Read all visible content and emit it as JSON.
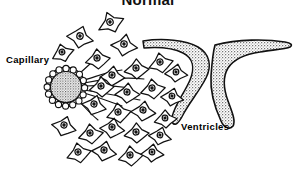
{
  "figure": {
    "title": "Normal",
    "width": 296,
    "height": 169,
    "background_color": "#ffffff",
    "ink_color": "#000000",
    "stipple_color": "#b4b4b4",
    "labels": {
      "capillary": "Capillary",
      "ventricles": "Ventricles"
    },
    "structures": {
      "capillary": {
        "name": "capillary",
        "shape": "stippled circle with scalloped endothelial ring",
        "center_x": 66,
        "center_y": 87,
        "radius": 18,
        "fill": "#c8c8c8"
      },
      "ventricle_inner": {
        "name": "ventricle-inner",
        "shape": "crescent hook opening left",
        "fill": "#c4c4c4"
      },
      "ventricle_outer": {
        "name": "ventricle-outer",
        "shape": "larger crescent hook opening left",
        "fill": "#c4c4c4"
      },
      "astrocytes": {
        "name": "astrocytes",
        "description": "star-shaped glial cells with central nucleus and radiating processes",
        "count": 26,
        "fill": "#ffffff",
        "nucleus_fill": "#ffffff"
      }
    },
    "cells": [
      {
        "x": 110,
        "y": 22,
        "r": 13,
        "rot": -18
      },
      {
        "x": 80,
        "y": 36,
        "r": 13,
        "rot": 12
      },
      {
        "x": 124,
        "y": 44,
        "r": 13,
        "rot": 8
      },
      {
        "x": 97,
        "y": 58,
        "r": 12,
        "rot": -8
      },
      {
        "x": 136,
        "y": 68,
        "r": 12,
        "rot": -4
      },
      {
        "x": 160,
        "y": 62,
        "r": 12,
        "rot": -14
      },
      {
        "x": 176,
        "y": 72,
        "r": 11,
        "rot": 6
      },
      {
        "x": 112,
        "y": 75,
        "r": 12,
        "rot": 4
      },
      {
        "x": 101,
        "y": 86,
        "r": 12,
        "rot": -6
      },
      {
        "x": 127,
        "y": 92,
        "r": 12,
        "rot": 2
      },
      {
        "x": 152,
        "y": 88,
        "r": 12,
        "rot": -10
      },
      {
        "x": 172,
        "y": 96,
        "r": 11,
        "rot": 10
      },
      {
        "x": 94,
        "y": 104,
        "r": 12,
        "rot": 14
      },
      {
        "x": 118,
        "y": 112,
        "r": 12,
        "rot": -12
      },
      {
        "x": 143,
        "y": 110,
        "r": 12,
        "rot": 6
      },
      {
        "x": 165,
        "y": 118,
        "r": 11,
        "rot": -6
      },
      {
        "x": 64,
        "y": 125,
        "r": 12,
        "rot": 16
      },
      {
        "x": 90,
        "y": 133,
        "r": 12,
        "rot": -10
      },
      {
        "x": 112,
        "y": 127,
        "r": 12,
        "rot": 8
      },
      {
        "x": 136,
        "y": 132,
        "r": 12,
        "rot": -4
      },
      {
        "x": 160,
        "y": 135,
        "r": 11,
        "rot": 12
      },
      {
        "x": 78,
        "y": 152,
        "r": 12,
        "rot": -14
      },
      {
        "x": 104,
        "y": 150,
        "r": 12,
        "rot": 10
      },
      {
        "x": 130,
        "y": 155,
        "r": 12,
        "rot": -8
      },
      {
        "x": 152,
        "y": 152,
        "r": 11,
        "rot": 4
      },
      {
        "x": 62,
        "y": 52,
        "r": 11,
        "rot": -20
      }
    ],
    "endfeet": [
      {
        "x1": 86,
        "y1": 80,
        "x2": 120,
        "y2": 72
      },
      {
        "x1": 86,
        "y1": 86,
        "x2": 130,
        "y2": 88
      },
      {
        "x1": 86,
        "y1": 92,
        "x2": 122,
        "y2": 104
      },
      {
        "x1": 80,
        "y1": 72,
        "x2": 100,
        "y2": 56
      },
      {
        "x1": 80,
        "y1": 100,
        "x2": 98,
        "y2": 116
      }
    ]
  }
}
